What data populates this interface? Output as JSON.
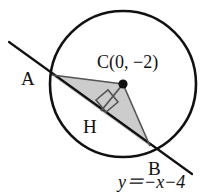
{
  "figure": {
    "background_color": "#ffffff",
    "stroke_color": "#111111",
    "fill_color": "#cccccc",
    "circle": {
      "center_x": 123,
      "center_y": 84,
      "radius": 73,
      "stroke_width": 2.6
    },
    "center_point": {
      "label": "C(0, −2)",
      "dot_x": 123,
      "dot_y": 84,
      "dot_radius": 4.6,
      "label_x": 97,
      "label_y": 68
    },
    "chord_line": {
      "equation_label": "y＝−x−4",
      "equation_x": 118,
      "equation_y": 188,
      "x1": 9,
      "y1": 42,
      "x2": 192,
      "y2": 174,
      "stroke_width": 2.2
    },
    "points": [
      {
        "name": "A",
        "label": "A",
        "x": 52,
        "y": 75,
        "label_x": 21,
        "label_y": 85
      },
      {
        "name": "B",
        "label": "B",
        "x": 150,
        "y": 146,
        "label_x": 148,
        "label_y": 175
      },
      {
        "name": "H",
        "label": "H",
        "x": 101,
        "y": 111,
        "label_x": 83,
        "label_y": 133
      }
    ],
    "triangle": {
      "fill": "#cccccc",
      "points": "52,75 123,84 150,146"
    },
    "right_angle_marker": {
      "points": "96,100 108,90 118,102 106,112",
      "size": 15
    },
    "segments": [
      {
        "name": "segment-CH",
        "x1": 123,
        "y1": 84,
        "x2": 101,
        "y2": 111
      },
      {
        "name": "segment-CA",
        "x1": 123,
        "y1": 84,
        "x2": 52,
        "y2": 75
      },
      {
        "name": "segment-CB",
        "x1": 123,
        "y1": 84,
        "x2": 150,
        "y2": 146
      }
    ]
  }
}
